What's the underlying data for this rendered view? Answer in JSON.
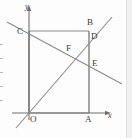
{
  "figure": {
    "type": "geometry-diagram",
    "canvas": {
      "width": 132,
      "height": 138
    },
    "stroke_color": "#7a7a7a",
    "axis_color": "#6f6f6f",
    "label_color": "#3a3a3a",
    "background": "#fdfdfd",
    "axes": [
      {
        "name": "y-axis",
        "label": "y",
        "label_x": 25,
        "label_y": 4,
        "arrow": "up"
      },
      {
        "name": "x-axis",
        "label": "x",
        "label_x": 108,
        "label_y": 114,
        "arrow": "right"
      }
    ],
    "points": [
      {
        "id": "O",
        "label": "O",
        "x": 29,
        "y": 113,
        "label_x": 30,
        "label_y": 116
      },
      {
        "id": "A",
        "label": "A",
        "x": 89,
        "y": 113,
        "label_x": 86,
        "label_y": 116
      },
      {
        "id": "B",
        "label": "B",
        "x": 89,
        "y": 31,
        "label_x": 88,
        "label_y": 19
      },
      {
        "id": "C",
        "label": "C",
        "x": 29,
        "y": 31,
        "label_x": 18,
        "label_y": 29
      },
      {
        "id": "D",
        "label": "D",
        "x": 89,
        "y": 38,
        "label_x": 91,
        "label_y": 34
      },
      {
        "id": "E",
        "label": "E",
        "x": 89,
        "y": 67,
        "label_x": 92,
        "label_y": 61
      },
      {
        "id": "F",
        "label": "F",
        "x": 70,
        "y": 53,
        "label_x": 67,
        "label_y": 45
      }
    ],
    "rectangle": {
      "name": "rectangle-OABC",
      "vertices": [
        "O",
        "A",
        "B",
        "C"
      ]
    },
    "lines": [
      {
        "name": "line-descending-CE",
        "x1": 7,
        "y1": 22,
        "x2": 122,
        "y2": 84,
        "through": [
          "C",
          "F",
          "E"
        ]
      },
      {
        "name": "line-ascending-OD",
        "x1": 16,
        "y1": 128,
        "x2": 112,
        "y2": 17,
        "through": [
          "O",
          "F",
          "D"
        ]
      }
    ]
  }
}
